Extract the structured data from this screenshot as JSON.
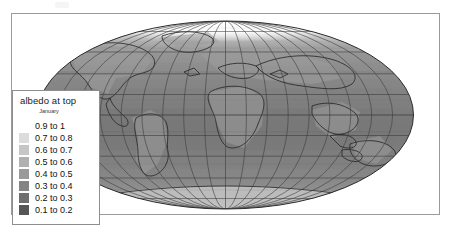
{
  "figure": {
    "title": "albedo at top",
    "subtitle": "January"
  },
  "legend": {
    "title": "albedo at top",
    "subtitle": "January",
    "items": [
      {
        "label": "0.9 to 1",
        "color": "#ffffff",
        "swatch_visible": false
      },
      {
        "label": "0.7 to 0.8",
        "color": "#dcdcdc",
        "swatch_visible": true
      },
      {
        "label": "0.6 to 0.7",
        "color": "#c6c6c6",
        "swatch_visible": true
      },
      {
        "label": "0.5 to 0.6",
        "color": "#b0b0b0",
        "swatch_visible": true
      },
      {
        "label": "0.4 to 0.5",
        "color": "#9a9a9a",
        "swatch_visible": true
      },
      {
        "label": "0.3 to 0.4",
        "color": "#848484",
        "swatch_visible": true
      },
      {
        "label": "0.2 to 0.3",
        "color": "#6e6e6e",
        "swatch_visible": true
      },
      {
        "label": "0.1 to 0.2",
        "color": "#565656",
        "swatch_visible": true
      }
    ]
  },
  "chart_data": {
    "type": "heatmap",
    "title": "albedo at top",
    "subtitle": "January",
    "xlabel": "",
    "ylabel": "",
    "projection": "Mollweide",
    "grid": true,
    "legend_position": "inside-left",
    "variable": "albedo at top",
    "period": "January",
    "xlim": [
      -180,
      180
    ],
    "ylim": [
      -90,
      90
    ],
    "graticule": {
      "meridian_spacing_deg": 20,
      "parallel_spacing_deg": 20,
      "meridians": [
        -180,
        -160,
        -140,
        -120,
        -100,
        -80,
        -60,
        -40,
        -20,
        0,
        20,
        40,
        60,
        80,
        100,
        120,
        140,
        160,
        180
      ],
      "parallels": [
        -80,
        -60,
        -40,
        -20,
        0,
        20,
        40,
        60,
        80
      ],
      "color": "#3c3c3c"
    },
    "colorbar_bins": [
      {
        "range": [
          0.9,
          1.0
        ],
        "label": "0.9 to 1",
        "color": "#ffffff"
      },
      {
        "range": [
          0.7,
          0.8
        ],
        "label": "0.7 to 0.8",
        "color": "#dcdcdc"
      },
      {
        "range": [
          0.6,
          0.7
        ],
        "label": "0.6 to 0.7",
        "color": "#c6c6c6"
      },
      {
        "range": [
          0.5,
          0.6
        ],
        "label": "0.5 to 0.6",
        "color": "#b0b0b0"
      },
      {
        "range": [
          0.4,
          0.5
        ],
        "label": "0.4 to 0.5",
        "color": "#9a9a9a"
      },
      {
        "range": [
          0.3,
          0.4
        ],
        "label": "0.3 to 0.4",
        "color": "#848484"
      },
      {
        "range": [
          0.2,
          0.3
        ],
        "label": "0.2 to 0.3",
        "color": "#6e6e6e"
      },
      {
        "range": [
          0.1,
          0.2
        ],
        "label": "0.1 to 0.2",
        "color": "#565656"
      }
    ],
    "regions": [
      {
        "name": "Arctic / North Pole",
        "albedo_bin": "0.9 to 1",
        "value": 0.95
      },
      {
        "name": "Northern high latitudes (snow)",
        "albedo_bin": "0.7 to 0.8",
        "value": 0.75
      },
      {
        "name": "Greenland",
        "albedo_bin": "0.7 to 0.8",
        "value": 0.75
      },
      {
        "name": "Sahara / desert belt",
        "albedo_bin": "0.4 to 0.5",
        "value": 0.45
      },
      {
        "name": "Mid-latitude land",
        "albedo_bin": "0.3 to 0.4",
        "value": 0.35
      },
      {
        "name": "Tropical ocean",
        "albedo_bin": "0.2 to 0.3",
        "value": 0.25
      },
      {
        "name": "Equatorial ocean",
        "albedo_bin": "0.1 to 0.2",
        "value": 0.18
      },
      {
        "name": "Antarctica",
        "albedo_bin": "0.5 to 0.6",
        "value": 0.55
      }
    ]
  }
}
